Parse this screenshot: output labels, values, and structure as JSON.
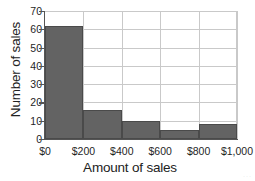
{
  "chart_data": {
    "type": "bar",
    "title": "",
    "subtitle": "",
    "xlabel": "Amount of sales",
    "ylabel": "Number of sales",
    "categories": [
      "$0-$200",
      "$200-$400",
      "$400-$600",
      "$600-$800",
      "$800-$1,000"
    ],
    "values": [
      62,
      16,
      10,
      5,
      8
    ],
    "bin_edges": [
      0,
      200,
      400,
      600,
      800,
      1000
    ],
    "xtick_labels": [
      "$0",
      "$200",
      "$400",
      "$600",
      "$800",
      "$1,000"
    ],
    "ytick_labels": [
      "0",
      "10",
      "20",
      "30",
      "40",
      "50",
      "60",
      "70"
    ],
    "ytick_values": [
      0,
      10,
      20,
      30,
      40,
      50,
      60,
      70
    ],
    "ylim": [
      0,
      70
    ],
    "xlim": [
      0,
      1000
    ],
    "grid": true,
    "legend": false,
    "legend_position": "none",
    "bar_color": "#636363",
    "bar_edge_color": "#4a4a4a",
    "grid_color": "#c9c9c9",
    "axis_color": "#555555",
    "background_color": "#ffffff"
  },
  "marks": {
    "corner_watermark": "···"
  }
}
